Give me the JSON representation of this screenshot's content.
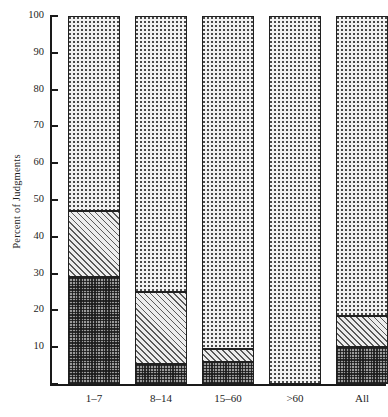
{
  "chart_data": {
    "type": "bar",
    "subtype": "stacked-bar-100-percent",
    "title": "",
    "xlabel": "",
    "ylabel": "Percent of Judgments",
    "ylim": [
      0,
      100
    ],
    "yticks": [
      0,
      10,
      20,
      30,
      40,
      50,
      60,
      70,
      80,
      90,
      100
    ],
    "ytick_labels": [
      "",
      "10",
      "20",
      "30",
      "40",
      "50",
      "60",
      "70",
      "80",
      "90",
      "100"
    ],
    "grid": false,
    "legend": "none",
    "categories": [
      "1–7",
      "8–14",
      "15–60",
      ">60",
      "All"
    ],
    "series": [
      {
        "name": "bottom-dark-checker",
        "pattern": "dark-checker",
        "values": [
          29,
          5.5,
          6,
          0,
          10
        ]
      },
      {
        "name": "middle-diagonal-hatch",
        "pattern": "diagonal-hatch",
        "values": [
          18,
          19.5,
          3.5,
          0,
          8.5
        ]
      },
      {
        "name": "top-light-dotted",
        "pattern": "light-dotted",
        "values": [
          53,
          75,
          90.5,
          100,
          81.5
        ]
      }
    ],
    "cumulative_tops": {
      "dark": [
        29,
        5.5,
        6,
        0,
        10
      ],
      "hatch": [
        47,
        25,
        9.5,
        0,
        18.5
      ],
      "dotted": [
        100,
        100,
        100,
        100,
        100
      ]
    },
    "colors": {
      "dark": "#9a9a9a",
      "hatch": "#ededed",
      "dotted": "#f2f2f2",
      "outline": "#202020",
      "axis": "#1a1a1a",
      "text": "#1d1d1d"
    }
  }
}
